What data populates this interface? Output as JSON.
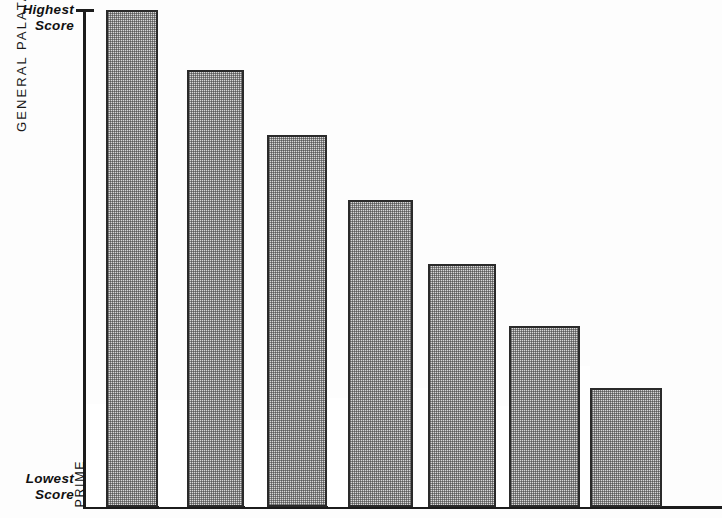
{
  "chart_data": {
    "type": "bar",
    "title": "",
    "subtitle": "",
    "xlabel": "",
    "ylabel": "GENERAL PALATABILITY VALUE",
    "categories": [
      "PRIME",
      "CHOICE",
      "GOOD",
      "STANDARD",
      "COMMERCIAL",
      "UTILITY",
      "CUTTER, CANNER"
    ],
    "values": [
      100,
      88,
      75,
      62,
      49,
      37,
      24
    ],
    "ylim": [
      0,
      100
    ],
    "y_axis_top_label": "Highest\nScore",
    "y_axis_bottom_label": "Lowest\nScore",
    "grid": false,
    "legend": false,
    "bar_fill": "#d8d8d8",
    "bar_stroke": "#2a2a2a",
    "axis_color": "#1c1c1c",
    "bars": [
      {
        "label": "PRIME",
        "left": 106,
        "width": 52,
        "top": 10,
        "height": 497
      },
      {
        "label": "CHOICE",
        "left": 187,
        "width": 57,
        "top": 70,
        "height": 437
      },
      {
        "label": "GOOD",
        "left": 267,
        "width": 60,
        "top": 135,
        "height": 372
      },
      {
        "label": "STANDARD",
        "left": 348,
        "width": 65,
        "top": 200,
        "height": 307
      },
      {
        "label": "COMMERCIAL",
        "left": 428,
        "width": 68,
        "top": 264,
        "height": 243
      },
      {
        "label": "UTILITY",
        "left": 509,
        "width": 71,
        "top": 326,
        "height": 181
      },
      {
        "label": "CUTTER, CANNER",
        "left": 590,
        "width": 72,
        "top": 388,
        "height": 119
      }
    ],
    "label_slots": [
      {
        "label": "PRIME",
        "left": 86,
        "width": 20,
        "top": 404,
        "height": 103
      },
      {
        "label": "CHOICE",
        "left": 159,
        "width": 28,
        "top": 400,
        "height": 107
      },
      {
        "label": "GOOD",
        "left": 245,
        "width": 22,
        "top": 420,
        "height": 87
      },
      {
        "label": "STANDARD",
        "left": 328,
        "width": 20,
        "top": 398,
        "height": 109
      },
      {
        "label": "COMMERCIAL",
        "left": 401,
        "width": 27,
        "top": 388,
        "height": 119
      },
      {
        "label": "UTILITY",
        "left": 489,
        "width": 20,
        "top": 406,
        "height": 101
      },
      {
        "label": "CUTTER, CANNER",
        "left": 562,
        "width": 28,
        "top": 366,
        "height": 141
      }
    ]
  }
}
